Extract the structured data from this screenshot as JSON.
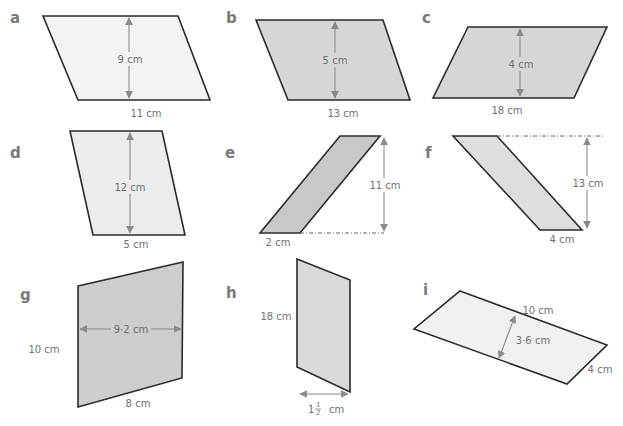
{
  "colors": {
    "fill_light": "#ececec",
    "fill_mid": "#d9d9d9",
    "fill_dark": "#c9c9c9",
    "outline": "#2a2a2a",
    "dimension_text": "#6f6f6f",
    "letter_label": "#7a7a7a",
    "arrow": "#8a8a8a"
  },
  "shapes": [
    {
      "label": "a",
      "dims": [
        "9 cm",
        "11 cm"
      ]
    },
    {
      "label": "b",
      "dims": [
        "5 cm",
        "13 cm"
      ]
    },
    {
      "label": "c",
      "dims": [
        "4 cm",
        "18 cm"
      ]
    },
    {
      "label": "d",
      "dims": [
        "12 cm",
        "5 cm"
      ]
    },
    {
      "label": "e",
      "dims": [
        "11 cm",
        "2 cm"
      ]
    },
    {
      "label": "f",
      "dims": [
        "13 cm",
        "4 cm"
      ]
    },
    {
      "label": "g",
      "dims": [
        "9·2 cm",
        "10 cm",
        "8 cm"
      ]
    },
    {
      "label": "h",
      "dims": [
        "18 cm",
        "1",
        "1",
        "2",
        "cm"
      ]
    },
    {
      "label": "i",
      "dims": [
        "10 cm",
        "3·6 cm",
        "4 cm"
      ]
    }
  ]
}
